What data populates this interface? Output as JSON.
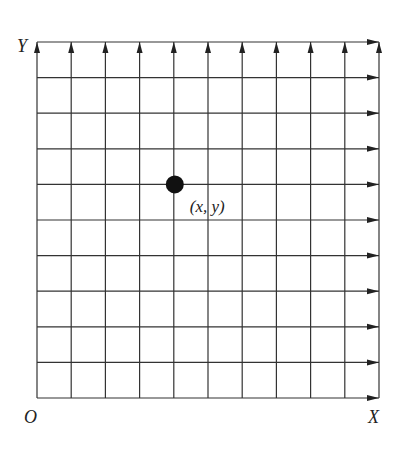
{
  "diagram": {
    "axes": {
      "y_label": "Y",
      "x_label": "X",
      "origin_label": "O"
    },
    "grid": {
      "columns": 10,
      "rows": 10,
      "x_start": 37,
      "x_end": 379,
      "y_top": 42,
      "y_bottom": 398,
      "line_color": "#333333",
      "vertical_arrows": "up",
      "horizontal_arrows": "right"
    },
    "point": {
      "label": "(x, y)",
      "grid_x": 4,
      "grid_y": 6,
      "color": "#111111"
    }
  }
}
